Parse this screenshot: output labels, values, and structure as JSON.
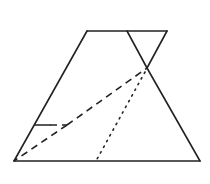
{
  "diagram": {
    "type": "geometry-figure",
    "stroke_color": "#222222",
    "background": "#ffffff",
    "vertices": {
      "top_left": [
        87,
        31
      ],
      "top_right": [
        167,
        31
      ],
      "bottom_left": [
        14,
        161
      ],
      "bottom_right": [
        200,
        161
      ],
      "fold_top": [
        127,
        31
      ],
      "fold_crossing": [
        147,
        68
      ],
      "left_side_point": [
        35,
        125
      ],
      "dash_joint": [
        67,
        125
      ],
      "dotted_bottom": [
        96,
        161
      ]
    }
  }
}
